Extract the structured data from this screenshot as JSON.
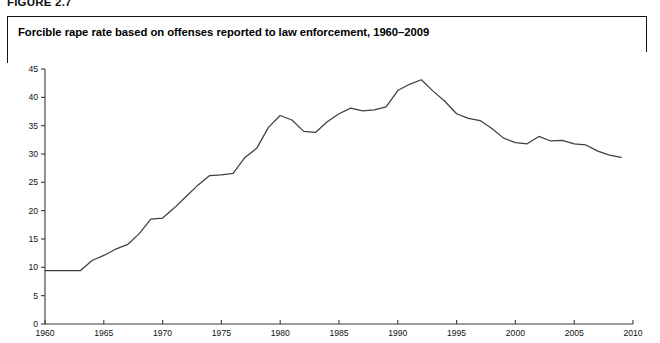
{
  "figure": {
    "number_label": "FIGURE 2.7",
    "title": "Forcible rape rate based on offenses reported to law enforcement, 1960–2009"
  },
  "chart_data": {
    "type": "line",
    "title": "Forcible rape rate based on offenses reported to law enforcement, 1960–2009",
    "xlabel": "",
    "ylabel": "",
    "xlim": [
      1960,
      2010
    ],
    "ylim": [
      0,
      45
    ],
    "grid": false,
    "legend": "none",
    "line_color": "#3f3f3f",
    "x_tick_labels": [
      "1960",
      "1965",
      "1970",
      "1975",
      "1980",
      "1985",
      "1990",
      "1995",
      "2000",
      "2005",
      "2010"
    ],
    "x_ticks": [
      1960,
      1965,
      1970,
      1975,
      1980,
      1985,
      1990,
      1995,
      2000,
      2005,
      2010
    ],
    "y_tick_labels": [
      "0",
      "5",
      "10",
      "15",
      "20",
      "25",
      "30",
      "35",
      "40",
      "45"
    ],
    "y_ticks": [
      0,
      5,
      10,
      15,
      20,
      25,
      30,
      35,
      40,
      45
    ],
    "x": [
      1960,
      1961,
      1962,
      1963,
      1964,
      1965,
      1966,
      1967,
      1968,
      1969,
      1970,
      1971,
      1972,
      1973,
      1974,
      1975,
      1976,
      1977,
      1978,
      1979,
      1980,
      1981,
      1982,
      1983,
      1984,
      1985,
      1986,
      1987,
      1988,
      1989,
      1990,
      1991,
      1992,
      1993,
      1994,
      1995,
      1996,
      1997,
      1998,
      1999,
      2000,
      2001,
      2002,
      2003,
      2004,
      2005,
      2006,
      2007,
      2008,
      2009
    ],
    "values": [
      9.4,
      9.4,
      9.4,
      9.4,
      11.2,
      12.1,
      13.2,
      14.0,
      15.9,
      18.5,
      18.7,
      20.5,
      22.5,
      24.5,
      26.2,
      26.3,
      26.6,
      29.4,
      31.0,
      34.7,
      36.8,
      36.0,
      34.0,
      33.8,
      35.7,
      37.1,
      38.1,
      37.6,
      37.8,
      38.3,
      41.2,
      42.3,
      43.1,
      41.1,
      39.3,
      37.1,
      36.3,
      35.9,
      34.5,
      32.8,
      32.0,
      31.8,
      33.1,
      32.3,
      32.4,
      31.8,
      31.6,
      30.5,
      29.8,
      29.4
    ]
  },
  "icons": {
    "plot_line": "line-series"
  }
}
